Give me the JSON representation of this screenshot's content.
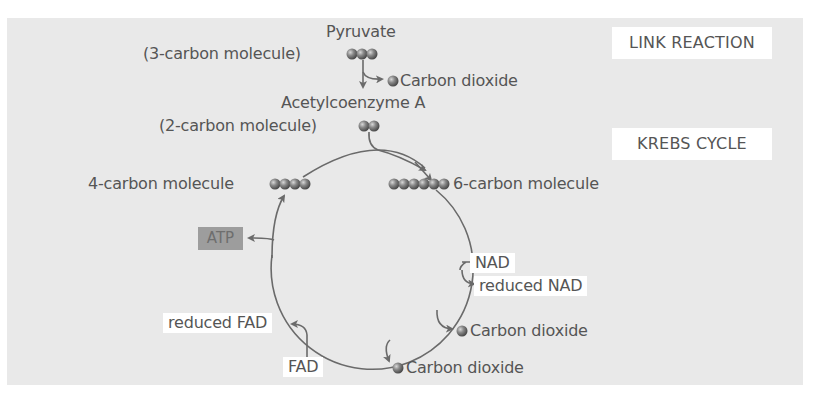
{
  "diagram": {
    "sections": {
      "link_reaction": "LINK REACTION",
      "krebs_cycle": "KREBS CYCLE"
    },
    "link_reaction": {
      "pyruvate_label": "Pyruvate",
      "pyruvate_desc": "(3-carbon molecule)",
      "pyruvate_carbons": 3,
      "co2_label": "Carbon dioxide",
      "acetyl_label": "Acetylcoenzyme A",
      "acetyl_desc": "(2-carbon molecule)",
      "acetyl_carbons": 2
    },
    "krebs": {
      "four_carbon_label": "4-carbon molecule",
      "four_carbons": 4,
      "six_carbon_label": "6-carbon molecule",
      "six_carbons": 6,
      "atp_label": "ATP",
      "nad_label": "NAD",
      "reduced_nad_label": "reduced NAD",
      "co2_label_1": "Carbon dioxide",
      "co2_label_2": "Carbon dioxide",
      "reduced_fad_label": "reduced FAD",
      "fad_label": "FAD"
    },
    "colors": {
      "panel": "#e9e9e9",
      "line": "#6a6a6a",
      "text": "#555555",
      "atp_box": "#9d9d9d",
      "molecule": "#7a7a7a"
    }
  }
}
